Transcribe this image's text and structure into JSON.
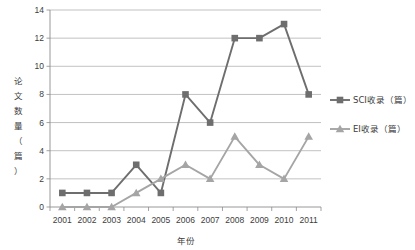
{
  "chart_data": {
    "type": "line",
    "title": "",
    "xlabel": "年份",
    "ylabel": "论文数量（篇）",
    "categories": [
      "2001",
      "2002",
      "2003",
      "2004",
      "2005",
      "2006",
      "2007",
      "2008",
      "2009",
      "2010",
      "2011"
    ],
    "series": [
      {
        "name": "SCI收录（篇）",
        "values": [
          1,
          1,
          1,
          3,
          1,
          8,
          6,
          12,
          12,
          13,
          8
        ],
        "color": "#6e6e6e",
        "marker": "square"
      },
      {
        "name": "EI收录（篇）",
        "values": [
          0,
          0,
          0,
          1,
          2,
          3,
          2,
          5,
          3,
          2,
          5
        ],
        "color": "#a5a5a5",
        "marker": "triangle"
      }
    ],
    "ylim": [
      0,
      14
    ],
    "ytick_step": 2,
    "yticks": [
      "0",
      "2",
      "4",
      "6",
      "8",
      "10",
      "12",
      "14"
    ],
    "grid": true,
    "legend_position": "right"
  },
  "legend": {
    "items": [
      {
        "label": "SCI收录（篇）"
      },
      {
        "label": "EI收录（篇）"
      }
    ]
  },
  "axes": {
    "y_title": "论文数量（篇）",
    "x_title": "年份"
  }
}
